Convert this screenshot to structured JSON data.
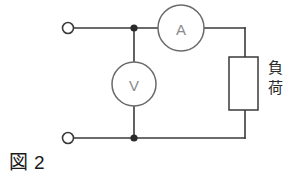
{
  "figure": {
    "caption_kanji": "図",
    "caption_number": "2",
    "background_color": "#ffffff",
    "wire_color": "#3a3a3a",
    "meter_outline_color": "#6a6a6a",
    "node_color": "#2a2a2a"
  },
  "components": {
    "ammeter": {
      "label": "A",
      "name": "ammeter",
      "shape": "circle",
      "cx": 181,
      "cy": 28,
      "r": 23
    },
    "voltmeter": {
      "label": "V",
      "name": "voltmeter",
      "shape": "circle",
      "cx": 134,
      "cy": 84,
      "r": 22
    },
    "load": {
      "label_char_1": "負",
      "label_char_2": "荷",
      "name": "load-resistor",
      "shape": "rectangle",
      "x": 229,
      "y": 57,
      "width": 29,
      "height": 53
    }
  },
  "terminals": [
    {
      "name": "input-terminal-top",
      "cx": 68,
      "cy": 28,
      "r": 5.5
    },
    {
      "name": "input-terminal-bottom",
      "cx": 68,
      "cy": 138,
      "r": 5.5
    }
  ],
  "nodes": [
    {
      "name": "junction-top",
      "cx": 134,
      "cy": 28,
      "r": 3.6
    },
    {
      "name": "junction-bottom",
      "cx": 134,
      "cy": 138,
      "r": 3.6
    }
  ],
  "wires": [
    {
      "name": "wire-top-left",
      "d": "M 73.5 28 L 158 28"
    },
    {
      "name": "wire-top-right",
      "d": "M 204 28 L 245 28"
    },
    {
      "name": "wire-right-upper",
      "d": "M 245 28 L 245 57"
    },
    {
      "name": "wire-right-lower",
      "d": "M 245 110 L 245 138"
    },
    {
      "name": "wire-bottom",
      "d": "M 73.5 138 L 245 138"
    },
    {
      "name": "wire-voltmeter-upper",
      "d": "M 134 28 L 134 62"
    },
    {
      "name": "wire-voltmeter-lower",
      "d": "M 134 106 L 134 138"
    }
  ]
}
